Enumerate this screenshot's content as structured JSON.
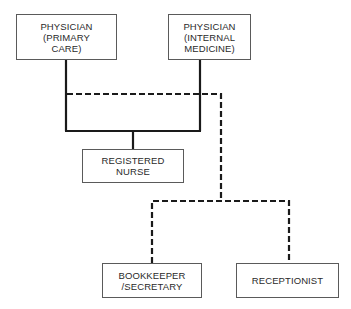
{
  "diagram": {
    "type": "organization-chart",
    "nodes": [
      {
        "id": "physician_primary",
        "lines": [
          "PHYSICIAN",
          "(PRIMARY",
          "CARE)"
        ]
      },
      {
        "id": "physician_internal",
        "lines": [
          "PHYSICIAN",
          "(INTERNAL",
          "MEDICINE)"
        ]
      },
      {
        "id": "registered_nurse",
        "lines": [
          "REGISTERED",
          "NURSE"
        ]
      },
      {
        "id": "bookkeeper",
        "lines": [
          "BOOKKEEPER",
          "/SECRETARY"
        ]
      },
      {
        "id": "receptionist",
        "lines": [
          "RECEPTIONIST"
        ]
      }
    ],
    "edges": [
      {
        "from": "physician_primary",
        "to": "registered_nurse",
        "style": "solid"
      },
      {
        "from": "physician_internal",
        "to": "registered_nurse",
        "style": "solid"
      },
      {
        "from": "physician_primary",
        "to": "bookkeeper",
        "style": "dashed"
      },
      {
        "from": "physician_internal",
        "to": "bookkeeper",
        "style": "dashed"
      },
      {
        "from": "physician_primary",
        "to": "receptionist",
        "style": "dashed"
      },
      {
        "from": "physician_internal",
        "to": "receptionist",
        "style": "dashed"
      }
    ],
    "colors": {
      "line": "#1a1a1a",
      "box_border": "#5a5a5a",
      "text": "#2a2a2a"
    }
  }
}
